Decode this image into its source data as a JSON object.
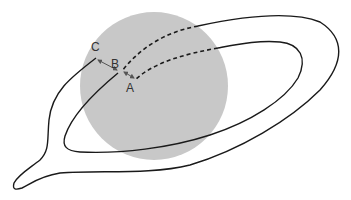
{
  "diagram": {
    "type": "orbit-path-schematic",
    "colors": {
      "sphere": "#c8c8c8",
      "line": "#1a1a1a",
      "arrow": "#555555",
      "label": "#333333"
    },
    "labels": {
      "a": "A",
      "b": "B",
      "c": "C"
    },
    "elements": [
      {
        "name": "sphere",
        "description": "Large gray filled circle"
      },
      {
        "name": "outer-path",
        "description": "Solid curve looping right and left, dashed inside sphere, ending at B"
      },
      {
        "name": "inner-path",
        "description": "Solid curve looping, dashed inside sphere, ending at A"
      },
      {
        "name": "arrow-c-b",
        "description": "Double-headed arrow between C and B"
      },
      {
        "name": "arrow-b-a",
        "description": "Double-headed arrow between B and A"
      }
    ]
  }
}
